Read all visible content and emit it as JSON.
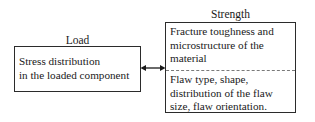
{
  "diagram": {
    "type": "two-box relationship diagram",
    "left": {
      "caption": "Load",
      "box_lines": "Stress distribution\nin the loaded component"
    },
    "right": {
      "caption": "Strength",
      "cell_top": "Fracture toughness and microstructure of the material",
      "cell_bottom": "Flaw type, shape, distribution of the flaw size, flaw orientation."
    },
    "connector": {
      "name": "double-headed-arrow",
      "description": "bidirectional arrow linking Load box and Strength box"
    },
    "colors": {
      "background": "#ffffff",
      "border": "#2b2b2b",
      "divider": "#7a7a7a",
      "text": "#1a1a1a"
    }
  }
}
